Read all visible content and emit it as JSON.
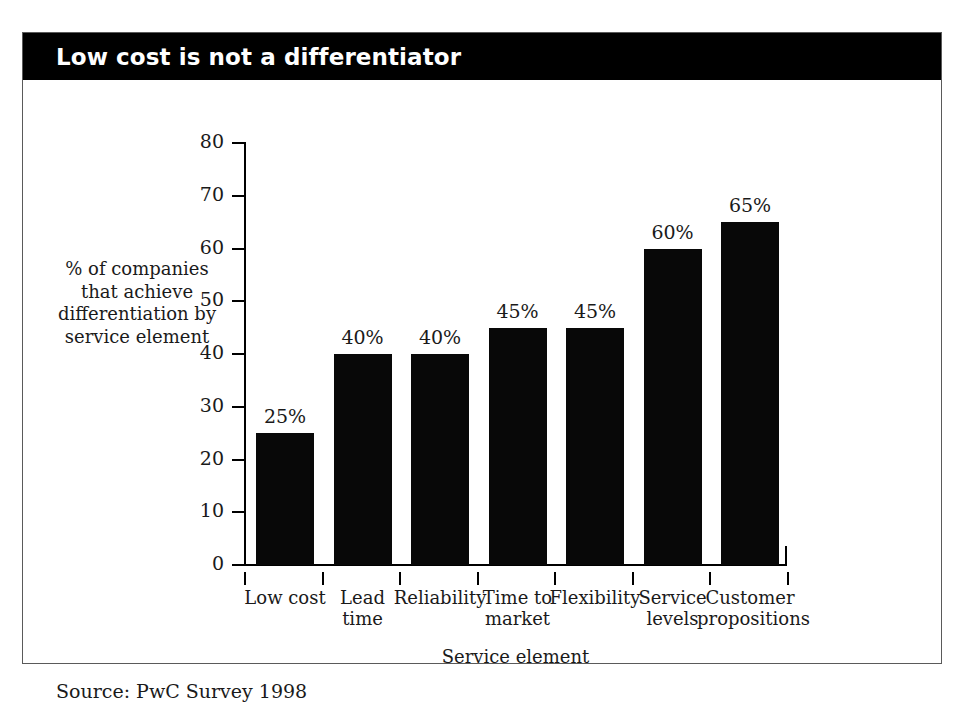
{
  "figure": {
    "title": "Low cost is not a differentiator",
    "source_note": "Source: PwC Survey 1998",
    "title_banner_color": "#000000",
    "title_text_color": "#ffffff",
    "bar_color": "#080808",
    "frame_color": "#5a5a5a",
    "background_color": "#ffffff"
  },
  "chart_data": {
    "type": "bar",
    "title": "Low cost is not a differentiator",
    "categories": [
      "Low cost",
      "Lead time",
      "Reliability",
      "Time to market",
      "Flexibility",
      "Service levels",
      "Customer propositions"
    ],
    "category_lines": [
      [
        "Low cost"
      ],
      [
        "Lead",
        "time"
      ],
      [
        "Reliability"
      ],
      [
        "Time to",
        "market"
      ],
      [
        "Flexibility"
      ],
      [
        "Service",
        "levels"
      ],
      [
        "Customer",
        "propositions"
      ]
    ],
    "values": [
      25,
      40,
      40,
      45,
      45,
      60,
      65
    ],
    "data_labels": [
      "25%",
      "40%",
      "40%",
      "45%",
      "45%",
      "60%",
      "65%"
    ],
    "xlabel": "Service element",
    "ylabel": "% of companies that achieve differentiation by service element",
    "ylabel_lines": [
      "% of companies",
      "that achieve",
      "differentiation by",
      "service element"
    ],
    "ylim": [
      0,
      80
    ],
    "ytick_step": 10,
    "yticks": [
      0,
      10,
      20,
      30,
      40,
      50,
      60,
      70,
      80
    ],
    "ytick_labels": [
      "0",
      "10",
      "20",
      "30",
      "40",
      "50",
      "60",
      "70",
      "80"
    ],
    "grid": false,
    "legend": null,
    "series_count": 1,
    "units": "percent"
  }
}
